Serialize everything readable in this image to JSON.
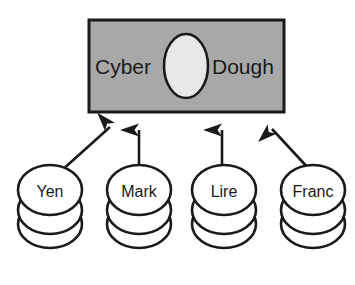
{
  "diagram": {
    "title_node": {
      "name": "cyber-dough-box",
      "words": {
        "left": "Cyber",
        "right": "Dough"
      },
      "shape": "rectangle",
      "fill_color": "#a8a8a8",
      "border_color": "#1a1a1a",
      "center_shape": "ellipse",
      "center_fill_color": "#e8e8e8"
    },
    "sources": [
      {
        "label": "Yen",
        "arrow": "diagonal-up-right"
      },
      {
        "label": "Mark",
        "arrow": "vertical-up"
      },
      {
        "label": "Lire",
        "arrow": "vertical-up"
      },
      {
        "label": "Franc",
        "arrow": "diagonal-up-left"
      }
    ],
    "coin_stack": {
      "coins_per_stack": 3,
      "outline_color": "#1a1a1a",
      "fill_color": "#ffffff"
    },
    "arrow_color": "#1a1a1a",
    "background_color": "#ffffff"
  }
}
